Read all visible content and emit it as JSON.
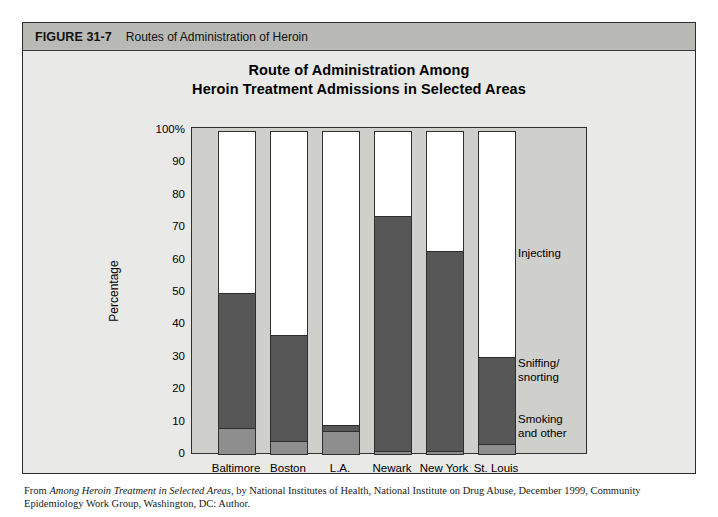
{
  "figure": {
    "number": "FIGURE 31-7",
    "caption": "Routes of Administration of Heroin"
  },
  "chart_title_line1": "Route of Administration Among",
  "chart_title_line2": "Heroin Treatment Admissions in Selected Areas",
  "source_prefix": "From ",
  "source_italic": "Among Heroin Treatment in Selected Areas",
  "source_rest": ", by National Institutes of Health, National Institute on Drug Abuse, December 1999, Community Epidemiology Work Group, Washington, DC: Author.",
  "legend": [
    {
      "label": "Injecting"
    },
    {
      "label": "Sniffing/\nsnorting"
    },
    {
      "label": "Smoking\nand other"
    }
  ],
  "colors": {
    "injecting": "#ffffff",
    "sniffing_snorting": "#575757",
    "smoking_and_other": "#8e8e8e",
    "plot_background": "#cfcfcc",
    "figure_background": "#e9e9e7",
    "header_background": "#b9b9b6",
    "axis": "#2f2f2f"
  },
  "chart_data": {
    "type": "bar",
    "subtype": "stacked-100-percent",
    "title": "Route of Administration Among Heroin Treatment Admissions in Selected Areas",
    "xlabel": "",
    "ylabel": "Percentage",
    "ylim": [
      0,
      100
    ],
    "yticks": [
      0,
      10,
      20,
      30,
      40,
      50,
      60,
      70,
      80,
      90,
      100
    ],
    "ytick_labels": [
      "0",
      "10",
      "20",
      "30",
      "40",
      "50",
      "60",
      "70",
      "80",
      "90",
      "100%"
    ],
    "grid": false,
    "legend_position": "inside-right",
    "categories": [
      "Baltimore",
      "Boston",
      "L.A.",
      "Newark",
      "New York",
      "St. Louis"
    ],
    "series": [
      {
        "name": "Smoking and other",
        "color": "#8e8e8e",
        "values": [
          8,
          4,
          7,
          1,
          1,
          3
        ]
      },
      {
        "name": "Sniffing/snorting",
        "color": "#575757",
        "values": [
          42,
          33,
          2,
          73,
          62,
          27
        ]
      },
      {
        "name": "Injecting",
        "color": "#ffffff",
        "values": [
          50,
          63,
          91,
          26,
          37,
          70
        ]
      }
    ],
    "cumulative_tops": {
      "Baltimore": {
        "smoking_and_other": 8,
        "sniffing_snorting": 50
      },
      "Boston": {
        "smoking_and_other": 4,
        "sniffing_snorting": 37
      },
      "L.A.": {
        "smoking_and_other": 7,
        "sniffing_snorting": 9
      },
      "Newark": {
        "smoking_and_other": 1,
        "sniffing_snorting": 74
      },
      "New York": {
        "smoking_and_other": 1,
        "sniffing_snorting": 63
      },
      "St. Louis": {
        "smoking_and_other": 3,
        "sniffing_snorting": 30
      }
    }
  }
}
